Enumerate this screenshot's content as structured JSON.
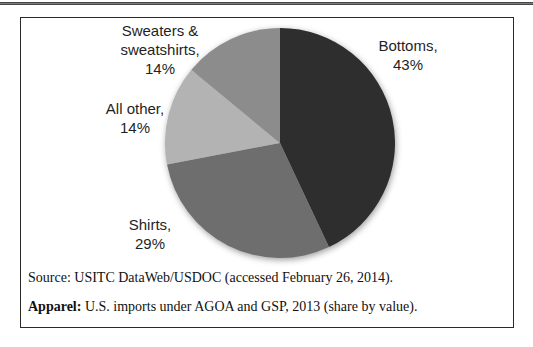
{
  "chart_data": {
    "type": "pie",
    "title": "Apparel: U.S. imports under AGOA and GSP, 2013 (share by value)",
    "source": "Source: USITC DataWeb/USDOC (accessed February 26, 2014).",
    "unit": "%",
    "start_angle_deg": 0,
    "direction": "clockwise",
    "legend_position": "none",
    "categories": [
      "Bottoms",
      "Shirts",
      "All other",
      "Sweaters & sweatshirts"
    ],
    "values": [
      43,
      29,
      14,
      14
    ],
    "slices": [
      {
        "id": "bottoms",
        "category": "Bottoms",
        "value": 43,
        "color": "#2e2e2e",
        "label": "Bottoms,\n43%"
      },
      {
        "id": "shirts",
        "category": "Shirts",
        "value": 29,
        "color": "#6e6e6e",
        "label": "Shirts,\n29%"
      },
      {
        "id": "all-other",
        "category": "All other",
        "value": 14,
        "color": "#b3b3b3",
        "label": "All other,\n14%"
      },
      {
        "id": "sweaters",
        "category": "Sweaters & sweatshirts",
        "value": 14,
        "color": "#8c8c8c",
        "label": "Sweaters &\nsweatshirts,\n14%"
      }
    ]
  },
  "notes": {
    "source_line": "Source: USITC DataWeb/USDOC (accessed February 26, 2014).",
    "caption_bold": "Apparel:",
    "caption_rest": " U.S. imports under AGOA and GSP, 2013 (share by value)."
  }
}
